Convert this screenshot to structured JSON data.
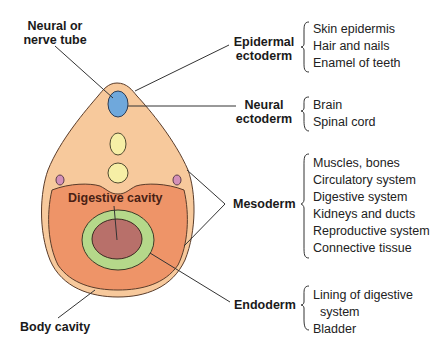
{
  "labels": {
    "neural_tube": [
      "Neural or",
      "nerve tube"
    ],
    "epidermal_ectoderm": [
      "Epidermal",
      "ectoderm"
    ],
    "neural_ectoderm": [
      "Neural",
      "ectoderm"
    ],
    "mesoderm": "Mesoderm",
    "endoderm": "Endoderm",
    "digestive_cavity": "Digestive cavity",
    "body_cavity": "Body cavity"
  },
  "derivatives": {
    "epidermal_ectoderm": [
      "Skin epidermis",
      "Hair and nails",
      "Enamel of teeth"
    ],
    "neural_ectoderm": [
      "Brain",
      "Spinal cord"
    ],
    "mesoderm": [
      "Muscles, bones",
      "Circulatory system",
      "Digestive system",
      "Kidneys and ducts",
      "Reproductive system",
      "Connective tissue"
    ],
    "endoderm": [
      "Lining of digestive",
      "  system",
      "Bladder"
    ]
  },
  "colors": {
    "ectoderm": "#f7c99c",
    "mesoderm": "#ee9468",
    "endoderm_ring": "#b5d88a",
    "gut_lumen": "#b8706a",
    "neural_tube": "#6fa8dc",
    "notochord": "#f6efa6",
    "somite_dot": "#d490b8",
    "outline": "#5a3c2a"
  }
}
